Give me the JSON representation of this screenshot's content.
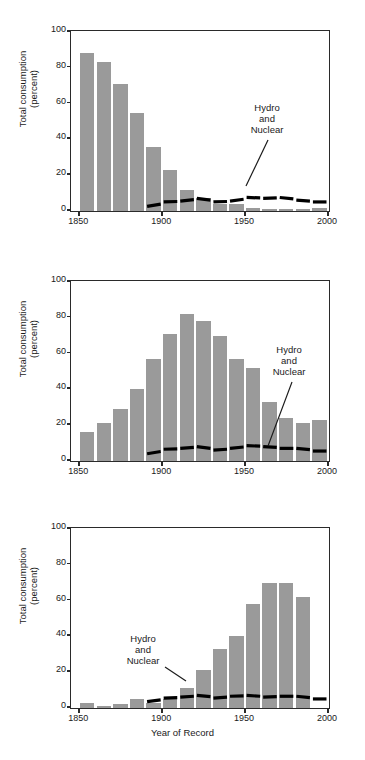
{
  "figure": {
    "xlabel": "Year of Record",
    "ylabel_line1": "Total consumption",
    "ylabel_line2": "(percent)",
    "bar_color": "#9a9a9a",
    "line_color": "#000000",
    "axis_color": "#2a2a2a",
    "yticks": [
      "0",
      "20",
      "40",
      "60",
      "80",
      "100"
    ],
    "xticks": [
      "1850",
      "1900",
      "1950",
      "2000"
    ],
    "annotation_line1": "Hydro",
    "annotation_line2": "and",
    "annotation_line3": "Nuclear"
  },
  "chart_data": [
    {
      "type": "bar",
      "title": "Wood",
      "xlabel": "Year of Record",
      "ylabel": "Total consumption (percent)",
      "ylim": [
        0,
        100
      ],
      "xlim": [
        1845,
        2000
      ],
      "grid": false,
      "legend": "none",
      "categories": [
        1850,
        1860,
        1870,
        1880,
        1890,
        1900,
        1910,
        1920,
        1930,
        1940,
        1950,
        1960,
        1970,
        1980,
        1990
      ],
      "values": [
        88,
        83,
        71,
        55,
        36,
        23,
        12,
        7,
        4,
        4,
        1.5,
        1,
        1,
        1,
        1.5
      ],
      "series": [
        {
          "name": "Hydro and Nuclear",
          "style": "dashed-line",
          "x": [
            1890,
            1900,
            1910,
            1920,
            1930,
            1940,
            1950,
            1960,
            1970,
            1980,
            1990
          ],
          "values": [
            2,
            4.5,
            5,
            6.5,
            4.5,
            5,
            7,
            6.5,
            7,
            5.5,
            4.5
          ]
        }
      ],
      "annotation": "Hydro and Nuclear"
    },
    {
      "type": "bar",
      "title": "Coal",
      "xlabel": "Year of Record",
      "ylabel": "Total consumption (percent)",
      "ylim": [
        0,
        100
      ],
      "xlim": [
        1845,
        2000
      ],
      "grid": false,
      "legend": "none",
      "categories": [
        1850,
        1860,
        1870,
        1880,
        1890,
        1900,
        1910,
        1920,
        1930,
        1940,
        1950,
        1960,
        1970,
        1980,
        1990
      ],
      "values": [
        16,
        21,
        29,
        40,
        57,
        71,
        82,
        78,
        70,
        57,
        52,
        33,
        24,
        21,
        23
      ],
      "series": [
        {
          "name": "Hydro and Nuclear",
          "style": "dashed-line",
          "x": [
            1890,
            1900,
            1910,
            1920,
            1930,
            1940,
            1950,
            1960,
            1970,
            1980,
            1990
          ],
          "values": [
            3.5,
            6,
            6.5,
            7.5,
            5.5,
            6.5,
            8,
            7.5,
            6.5,
            6.5,
            5
          ]
        }
      ],
      "annotation": "Hydro and Nuclear"
    },
    {
      "type": "bar",
      "title": "Oil and gas",
      "xlabel": "Year of Record",
      "ylabel": "Total consumption (percent)",
      "ylim": [
        0,
        100
      ],
      "xlim": [
        1845,
        2000
      ],
      "grid": false,
      "legend": "none",
      "categories": [
        1850,
        1860,
        1870,
        1880,
        1890,
        1900,
        1910,
        1920,
        1930,
        1940,
        1950,
        1960,
        1970,
        1980,
        1990
      ],
      "values": [
        3,
        1,
        2,
        5,
        3,
        5,
        11,
        21,
        33,
        40,
        58,
        70,
        70,
        62,
        0
      ],
      "series": [
        {
          "name": "Hydro and Nuclear",
          "style": "dashed-line",
          "x": [
            1890,
            1900,
            1910,
            1920,
            1930,
            1940,
            1950,
            1960,
            1970,
            1980,
            1990
          ],
          "values": [
            3,
            5,
            5.5,
            6.5,
            5,
            6,
            6.5,
            5.5,
            6,
            6,
            4.5
          ]
        }
      ],
      "annotation": "Hydro and Nuclear"
    }
  ]
}
